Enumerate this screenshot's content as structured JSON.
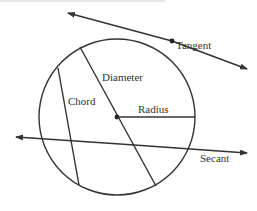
{
  "diagram": {
    "colors": {
      "stroke": "#333333",
      "text": "#333333",
      "background": "#ffffff"
    },
    "circle": {
      "cx": 117,
      "cy": 117,
      "r": 78
    },
    "labels": {
      "tangent": "Tangent",
      "diameter": "Diameter",
      "chord": "Chord",
      "radius": "Radius",
      "secant": "Secant"
    },
    "elements": [
      {
        "name": "tangent",
        "from": [
          68,
          13
        ],
        "to": [
          247,
          69
        ],
        "arrows": "both",
        "point": [
          172,
          41
        ]
      },
      {
        "name": "diameter",
        "from": [
          80,
          47
        ],
        "to": [
          156,
          186
        ],
        "center_point": [
          117,
          117
        ]
      },
      {
        "name": "chord",
        "from": [
          58,
          68
        ],
        "to": [
          79,
          185
        ]
      },
      {
        "name": "radius",
        "from": [
          117,
          117
        ],
        "to": [
          195,
          117
        ]
      },
      {
        "name": "secant",
        "from": [
          16,
          137
        ],
        "to": [
          247,
          153
        ],
        "arrows": "both"
      }
    ]
  }
}
